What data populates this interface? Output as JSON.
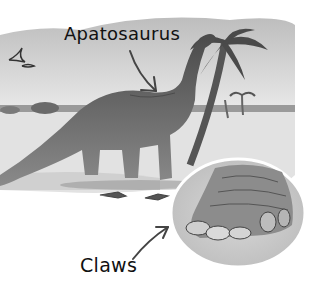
{
  "labels": {
    "apatosaurus": "Apatosaurus",
    "claws": "Claws"
  },
  "colors": {
    "background": "#ffffff",
    "sky": "#d6d6d6",
    "ground": "#e4e4e4",
    "dinosaur": "#5a5a5a",
    "ink": "#111111"
  }
}
